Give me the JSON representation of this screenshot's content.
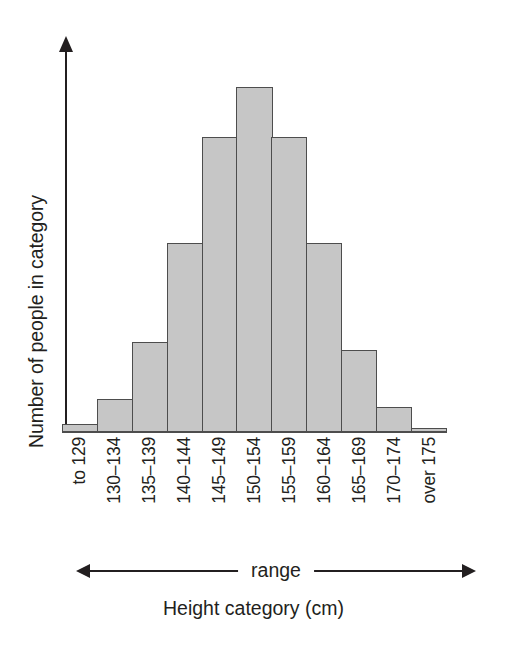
{
  "chart_data": {
    "type": "bar",
    "title": "",
    "subtitle": "",
    "xlabel": "Height category (cm)",
    "ylabel": "Number of people in category",
    "categories": [
      "to 129",
      "130–134",
      "135–139",
      "140–144",
      "145–149",
      "150–154",
      "155–159",
      "160–164",
      "165–169",
      "170–174",
      "over 175"
    ],
    "values": [
      1,
      4,
      11,
      23,
      36,
      42,
      36,
      23,
      10,
      3,
      0.5
    ],
    "value_unit": "people (unlabelled axis, heights estimated in relative units)",
    "ylim": [
      0,
      48
    ],
    "grid": false,
    "legend": null,
    "axis_ticks_shown": false,
    "bar_fill_color": "#c6c6c6",
    "bar_border_color": "#4d4d4d",
    "axis_color": "#231f20",
    "annotations": [
      {
        "name": "range-arrow",
        "label": "range",
        "description": "double-headed horizontal arrow spanning all categories below the x tick labels"
      }
    ]
  },
  "axes": {
    "y": {
      "label": "Number of people in category",
      "arrow": true
    },
    "x": {
      "title": "Height category (cm)",
      "tick_labels": [
        "to 129",
        "130–134",
        "135–139",
        "140–144",
        "145–149",
        "150–154",
        "155–159",
        "160–164",
        "165–169",
        "170–174",
        "over 175"
      ]
    }
  },
  "range_annotation": {
    "label": "range"
  }
}
